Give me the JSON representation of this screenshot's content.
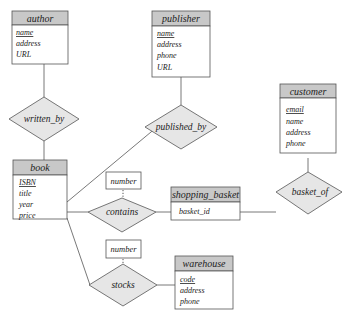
{
  "diagram": {
    "type": "ER diagram",
    "entities": [
      {
        "name": "author",
        "attributes": [
          "name",
          "address",
          "URL"
        ],
        "keys": [
          "name"
        ]
      },
      {
        "name": "publisher",
        "attributes": [
          "name",
          "address",
          "phone",
          "URL"
        ],
        "keys": [
          "name"
        ]
      },
      {
        "name": "customer",
        "attributes": [
          "email",
          "name",
          "address",
          "phone"
        ],
        "keys": [
          "email"
        ]
      },
      {
        "name": "book",
        "attributes": [
          "ISBN",
          "title",
          "year",
          "price"
        ],
        "keys": [
          "ISBN"
        ]
      },
      {
        "name": "shopping_basket",
        "attributes": [
          "basket_id"
        ],
        "keys": []
      },
      {
        "name": "warehouse",
        "attributes": [
          "code",
          "address",
          "phone"
        ],
        "keys": [
          "code"
        ]
      }
    ],
    "relationships": [
      {
        "name": "written_by",
        "connects": [
          "author",
          "book"
        ]
      },
      {
        "name": "published_by",
        "connects": [
          "publisher",
          "book"
        ]
      },
      {
        "name": "basket_of",
        "connects": [
          "customer",
          "shopping_basket"
        ]
      },
      {
        "name": "contains",
        "connects": [
          "book",
          "shopping_basket"
        ],
        "attribute": "number"
      },
      {
        "name": "stocks",
        "connects": [
          "book",
          "warehouse"
        ],
        "attribute": "number"
      }
    ],
    "relationship_attributes": {
      "contains_attr": "number",
      "stocks_attr": "number"
    }
  }
}
